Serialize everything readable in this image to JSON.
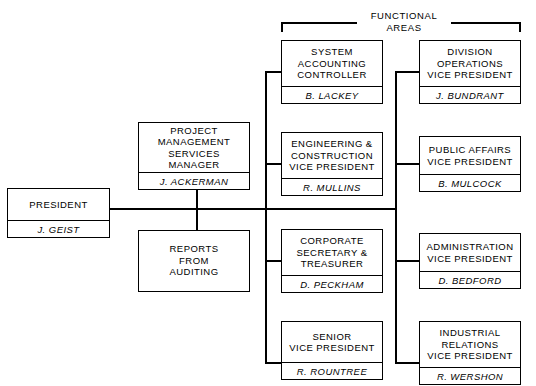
{
  "chart_title": "FUNCTIONAL AREAS",
  "bracket": {
    "label": "FUNCTIONAL\nAREAS"
  },
  "nodes": {
    "president": {
      "title": "PRESIDENT",
      "person": "J. GEIST"
    },
    "project_mgmt": {
      "title": "PROJECT\nMANAGEMENT\nSERVICES\nMANAGER",
      "person": "J. ACKERMAN"
    },
    "reports_auditing": {
      "title": "REPORTS\nFROM\nAUDITING",
      "person": ""
    },
    "system_accounting": {
      "title": "SYSTEM\nACCOUNTING\nCONTROLLER",
      "person": "B. LACKEY"
    },
    "engineering": {
      "title": "ENGINEERING &\nCONSTRUCTION\nVICE PRESIDENT",
      "person": "R. MULLINS"
    },
    "corporate_secretary": {
      "title": "CORPORATE\nSECRETARY &\nTREASURER",
      "person": "D. PECKHAM"
    },
    "senior_vp": {
      "title": "SENIOR\nVICE PRESIDENT",
      "person": "R. ROUNTREE"
    },
    "division_operations": {
      "title": "DIVISION\nOPERATIONS\nVICE PRESIDENT",
      "person": "J. BUNDRANT"
    },
    "public_affairs": {
      "title": "PUBLIC AFFAIRS\nVICE PRESIDENT",
      "person": "B. MULCOCK"
    },
    "administration": {
      "title": "ADMINISTRATION\nVICE PRESIDENT",
      "person": "D. BEDFORD"
    },
    "industrial_relations": {
      "title": "INDUSTRIAL\nRELATIONS\nVICE PRESIDENT",
      "person": "R. WERSHON"
    }
  },
  "colors": {
    "line": "#000000",
    "background": "#ffffff",
    "text": "#000000"
  }
}
